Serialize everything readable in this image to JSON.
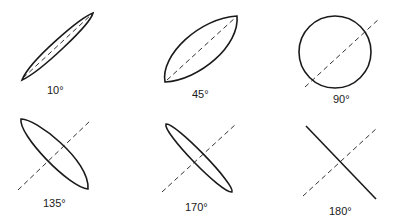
{
  "figure": {
    "colors": {
      "stroke": "#1a1a1a",
      "axis": "#333333",
      "background": "#ffffff"
    },
    "panels": [
      {
        "label": "10°",
        "shape": "narrow-ellipse"
      },
      {
        "label": "45°",
        "shape": "lens-ellipse"
      },
      {
        "label": "90°",
        "shape": "circle"
      },
      {
        "label": "135°",
        "shape": "ellipse-perpendicular"
      },
      {
        "label": "170°",
        "shape": "narrow-ellipse-perpendicular"
      },
      {
        "label": "180°",
        "shape": "line-perpendicular"
      }
    ]
  }
}
